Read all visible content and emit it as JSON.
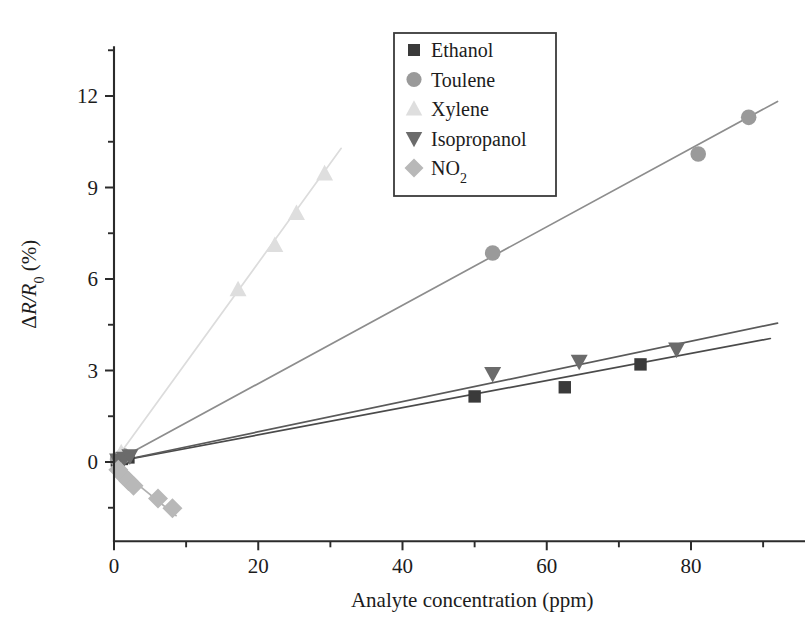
{
  "chart_data": {
    "type": "scatter",
    "title": "",
    "subtitle": "",
    "xlabel": "Analyte concentration (ppm)",
    "ylabel": "ΔR/R₀ (%)",
    "ylabel_parts": {
      "delta": "Δ",
      "r_over": "R/R",
      "sub": "0",
      "units": " (%)"
    },
    "xlim": [
      -3,
      96
    ],
    "ylim": [
      -2.6,
      13.6
    ],
    "xticks": [
      0,
      20,
      40,
      60,
      80
    ],
    "xticklabels": [
      "0",
      "20",
      "40",
      "60",
      "80"
    ],
    "xminor": [
      10,
      30,
      50,
      70,
      90
    ],
    "yticks": [
      0,
      3,
      6,
      9,
      12
    ],
    "yticklabels": [
      "0",
      "3",
      "6",
      "9",
      "12"
    ],
    "yminor": [
      -1.5,
      1.5,
      4.5,
      7.5,
      10.5,
      13.5
    ],
    "grid": false,
    "legend_position": "upper-center",
    "series": [
      {
        "name": "Ethanol",
        "marker": "square",
        "color": "#3a3a3a",
        "fit_color": "#4a4a4a",
        "fit_slope": 0.0445,
        "fit_intercept": 0.0,
        "fit_x_range": [
          0,
          91
        ],
        "points": [
          {
            "x": 0.4,
            "y": 0.05
          },
          {
            "x": 1.1,
            "y": 0.1
          },
          {
            "x": 2.0,
            "y": 0.15
          },
          {
            "x": 50.0,
            "y": 2.15
          },
          {
            "x": 62.5,
            "y": 2.45
          },
          {
            "x": 73.0,
            "y": 3.2
          }
        ]
      },
      {
        "name": "Toulene",
        "marker": "circle",
        "color": "#9a9a9a",
        "fit_color": "#8d8d8d",
        "fit_slope": 0.1285,
        "fit_intercept": 0.0,
        "fit_x_range": [
          0,
          92
        ],
        "points": [
          {
            "x": 0.5,
            "y": 0.08
          },
          {
            "x": 1.3,
            "y": 0.2
          },
          {
            "x": 52.5,
            "y": 6.85
          },
          {
            "x": 81.0,
            "y": 10.1
          },
          {
            "x": 88.0,
            "y": 11.3
          }
        ]
      },
      {
        "name": "Xylene",
        "marker": "triangle-up",
        "color": "#dedede",
        "fit_color": "#dcdcdc",
        "fit_slope": 0.3265,
        "fit_intercept": 0.0,
        "fit_x_range": [
          0,
          31.5
        ],
        "points": [
          {
            "x": 1.0,
            "y": 0.3
          },
          {
            "x": 17.2,
            "y": 5.65
          },
          {
            "x": 22.3,
            "y": 7.1
          },
          {
            "x": 25.3,
            "y": 8.15
          },
          {
            "x": 29.2,
            "y": 9.45
          }
        ]
      },
      {
        "name": "Isopropanol",
        "marker": "triangle-down",
        "color": "#6b6b6b",
        "fit_color": "#5a5a5a",
        "fit_slope": 0.0495,
        "fit_intercept": 0.0,
        "fit_x_range": [
          0,
          92
        ],
        "points": [
          {
            "x": 0.5,
            "y": 0.06
          },
          {
            "x": 1.4,
            "y": 0.12
          },
          {
            "x": 2.2,
            "y": 0.2
          },
          {
            "x": 52.5,
            "y": 2.9
          },
          {
            "x": 64.5,
            "y": 3.3
          },
          {
            "x": 78.0,
            "y": 3.7
          }
        ]
      },
      {
        "name": "NO2",
        "marker": "diamond",
        "color": "#b8b8b8",
        "fit_color": "#b0b0b0",
        "fit_slope": -0.193,
        "fit_intercept": -0.1,
        "fit_x_range": [
          0,
          8.6
        ],
        "points": [
          {
            "x": 0.6,
            "y": -0.25
          },
          {
            "x": 1.3,
            "y": -0.45
          },
          {
            "x": 2.0,
            "y": -0.62
          },
          {
            "x": 2.7,
            "y": -0.78
          },
          {
            "x": 6.1,
            "y": -1.2
          },
          {
            "x": 8.1,
            "y": -1.52
          }
        ]
      }
    ]
  },
  "legend": {
    "items": [
      {
        "label": "Ethanol",
        "marker": "square",
        "color": "#3a3a3a",
        "sub": ""
      },
      {
        "label": "Toulene",
        "marker": "circle",
        "color": "#9a9a9a",
        "sub": ""
      },
      {
        "label": "Xylene",
        "marker": "triangle-up",
        "color": "#dedede",
        "sub": ""
      },
      {
        "label": "Isopropanol",
        "marker": "triangle-down",
        "color": "#6b6b6b",
        "sub": ""
      },
      {
        "label": "NO",
        "marker": "diamond",
        "color": "#b8b8b8",
        "sub": "2"
      }
    ]
  },
  "colors": {
    "background": "#ffffff",
    "axis": "#2b2b2b",
    "text": "#1c1c1c",
    "legend_border": "#3a3a3a"
  }
}
